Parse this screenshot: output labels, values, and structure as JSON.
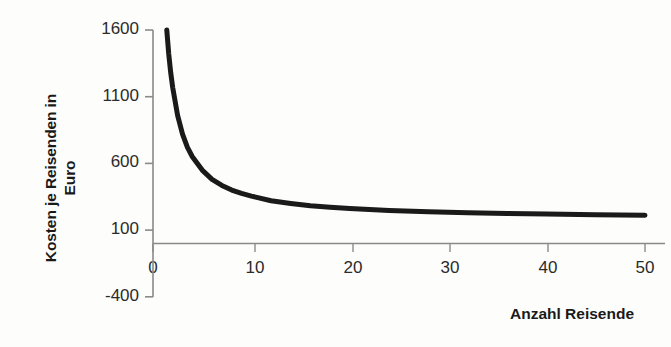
{
  "chart_data": {
    "type": "line",
    "title": "",
    "xlabel": "Anzahl Reisende",
    "ylabel_line1": "Kosten je Reisenden in",
    "ylabel_line2": "Euro",
    "ylabel": "Kosten je Reisenden in Euro",
    "xlim": [
      0,
      50
    ],
    "ylim": [
      -400,
      1600
    ],
    "xticks": [
      0,
      10,
      20,
      30,
      40,
      50
    ],
    "xtick_labels": [
      "0",
      "10",
      "20",
      "30",
      "40",
      "50"
    ],
    "yticks": [
      -400,
      100,
      600,
      1100,
      1600
    ],
    "ytick_labels": [
      "-400",
      "100",
      "600",
      "1100",
      "1600"
    ],
    "grid": false,
    "series": [
      {
        "name": "Kosten je Reisenden",
        "color": "#1a1a1a",
        "line_width": 5,
        "x": [
          1.4,
          1.6,
          1.8,
          2,
          2.5,
          3,
          3.5,
          4,
          5,
          6,
          7,
          8,
          9,
          10,
          12,
          14,
          16,
          18,
          20,
          24,
          28,
          32,
          36,
          40,
          45,
          50
        ],
        "y": [
          1600,
          1420,
          1280,
          1170,
          960,
          820,
          720,
          650,
          550,
          480,
          435,
          400,
          375,
          355,
          320,
          300,
          283,
          272,
          262,
          247,
          237,
          230,
          225,
          220,
          216,
          212
        ]
      }
    ],
    "annotations": []
  },
  "axis": {
    "axis_color": "#808080",
    "tick_color": "#808080",
    "label_color": "#2b2b2b",
    "title_color": "#1a1a1a",
    "background": "#fdfdfb"
  }
}
